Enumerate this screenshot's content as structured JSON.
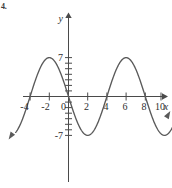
{
  "figure": {
    "problem_label": "4.",
    "background_color": "#ffffff",
    "curve_color": "#5a5a5a",
    "axis_color": "#4a4a4a",
    "label_color": "#2e2e2e"
  },
  "axes": {
    "x_axis_name": "x",
    "y_axis_name": "y",
    "x_tick_labels": [
      "-4",
      "-2",
      "0",
      "2",
      "4",
      "6",
      "8",
      "10"
    ],
    "x_tick_values": [
      -4,
      -2,
      0,
      2,
      4,
      6,
      8,
      10
    ],
    "y_tick_labels": [
      "7",
      "-7"
    ],
    "y_tick_values": [
      7,
      -7
    ]
  },
  "chart_data": {
    "type": "line",
    "title": "",
    "subtitle": "",
    "xlabel": "x",
    "ylabel": "y",
    "xlim": [
      -5.5,
      11.6
    ],
    "ylim": [
      -9.2,
      9.2
    ],
    "grid": false,
    "legend": false,
    "legend_position": "none",
    "xticks": [
      -4,
      -2,
      0,
      2,
      4,
      6,
      8,
      10
    ],
    "xticklabels": [
      "-4",
      "-2",
      "0",
      "2",
      "4",
      "6",
      "8",
      "10"
    ],
    "yticks": [
      7,
      -7
    ],
    "yticklabels": [
      "7",
      "-7"
    ],
    "y_minor_tick_interval": 1,
    "function": "y = -7 sin(pi*x/4)",
    "amplitude": 7,
    "period": 8,
    "series": [
      {
        "name": "wave",
        "x": [
          -5.5,
          -5.0,
          -4.5,
          -4.0,
          -3.5,
          -3.0,
          -2.5,
          -2.0,
          -1.5,
          -1.0,
          -0.5,
          0.0,
          0.5,
          1.0,
          1.5,
          2.0,
          2.5,
          3.0,
          3.5,
          4.0,
          4.5,
          5.0,
          5.5,
          6.0,
          6.5,
          7.0,
          7.5,
          8.0,
          8.5,
          9.0,
          9.5,
          10.0,
          10.5,
          11.0,
          11.4
        ],
        "values": [
          -6.47,
          -4.95,
          -2.68,
          0.0,
          2.68,
          4.95,
          6.47,
          7.0,
          6.47,
          4.95,
          2.68,
          0.0,
          -2.68,
          -4.95,
          -6.47,
          -7.0,
          -6.47,
          -4.95,
          -2.68,
          0.0,
          2.68,
          4.95,
          6.47,
          7.0,
          6.47,
          4.95,
          2.68,
          0.0,
          -2.68,
          -4.95,
          -6.47,
          -7.0,
          -6.47,
          -4.95,
          -3.04
        ]
      }
    ],
    "annotations": {
      "maxima_x": [
        -2,
        6
      ],
      "maxima_y": 7,
      "minima_x": [
        2,
        10
      ],
      "minima_y": -7,
      "zeros_x": [
        -4,
        0,
        4,
        8
      ],
      "arrow_left": "down-left",
      "arrow_right": "up-right"
    }
  }
}
